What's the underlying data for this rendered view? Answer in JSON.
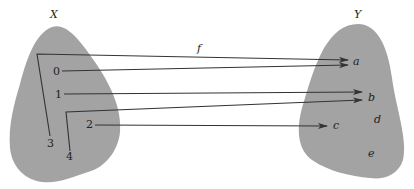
{
  "diagram": {
    "colors": {
      "blob": "#a3a3a3",
      "line": "#333333",
      "text": "#222222"
    },
    "function_label": "f",
    "domain": {
      "label": "X",
      "elements": [
        "0",
        "1",
        "2",
        "3",
        "4"
      ]
    },
    "codomain": {
      "label": "Y",
      "elements": [
        "a",
        "b",
        "c",
        "d",
        "e"
      ]
    },
    "mapping": [
      {
        "from": "3",
        "to": "a"
      },
      {
        "from": "0",
        "to": "a"
      },
      {
        "from": "1",
        "to": "b"
      },
      {
        "from": "4",
        "to": "b"
      },
      {
        "from": "2",
        "to": "c"
      }
    ]
  }
}
